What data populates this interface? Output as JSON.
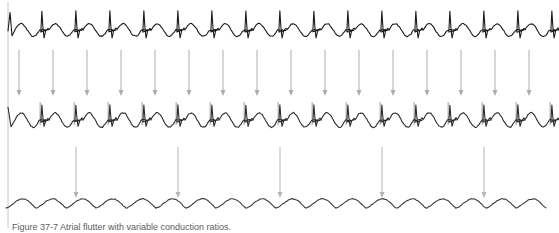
{
  "figure": {
    "background_color": "#ffffff",
    "width": 559,
    "height": 233,
    "left_rule": {
      "name": "left-vertical-rule",
      "color": "#c8c8c8",
      "x": 8,
      "y_top": 2,
      "y_bottom": 228,
      "width": 1
    },
    "caption": {
      "label": "Figure",
      "number": "37-7",
      "text": "Figure 37-7  Atrial flutter with variable conduction ratios.",
      "color": "#5c5c5c",
      "clipped": true,
      "note": "Caption line is cropped by the bottom edge of the image; only the upper sliver of glyphs is visible."
    }
  },
  "traces": [
    {
      "id": "strip-1",
      "name": "ecg-strip-top",
      "label": "Top rhythm strip",
      "color": "#1a1a1a",
      "stroke_width": 1.1,
      "baseline_y": 30,
      "x_start": 10,
      "x_end": 556,
      "beats": 16,
      "beat_spacing": 34,
      "morphology": "narrow QRS complexes with tall sharp R waves separated by rounded flutter/T waves; two rounded humps between each QRS",
      "qrs_amplitude": 19,
      "wave_amplitude": 7,
      "has_pacing_spikes": false
    },
    {
      "id": "strip-2",
      "name": "ecg-strip-middle",
      "label": "Middle rhythm strip",
      "color": "#2b2b2b",
      "stroke_width": 1.1,
      "baseline_y": 120,
      "x_start": 10,
      "x_end": 556,
      "beats": 16,
      "beat_spacing": 34,
      "morphology": "QRS complexes preceded by faint grey vertical marker spikes; rounded intervening waves, deeper S deflection",
      "qrs_amplitude": 15,
      "wave_amplitude": 8,
      "has_pacing_spikes": true,
      "spike_color": "#b9b9b9",
      "spike_height": 18
    },
    {
      "id": "strip-3",
      "name": "ecg-strip-bottom",
      "label": "Bottom rhythm strip",
      "color": "#3a3a3a",
      "stroke_width": 1.1,
      "baseline_y": 208,
      "x_start": 10,
      "x_end": 556,
      "beats": 18,
      "beat_spacing": 30,
      "morphology": "smooth undulating sawtooth flutter waves without discrete sharp QRS spikes",
      "qrs_amplitude": 0,
      "wave_amplitude": 9,
      "has_pacing_spikes": false
    }
  ],
  "arrow_rows": [
    {
      "id": "arrow-row-1",
      "name": "conduction-arrows-upper",
      "label": "Upper arrow row (strip 1 to strip 2)",
      "count": 16,
      "color": "#adadad",
      "line_width": 1,
      "y_top": 50,
      "y_bottom": 96,
      "x_first": 19,
      "spacing": 34,
      "head_width": 5,
      "head_height": 6,
      "direction": "down",
      "ratio_label": "1:1"
    },
    {
      "id": "arrow-row-2",
      "name": "conduction-arrows-lower",
      "label": "Lower arrow row (strip 2 to strip 3)",
      "count": 5,
      "color": "#b5b5b5",
      "line_width": 1,
      "y_top": 147,
      "y_bottom": 198,
      "x_first": 76,
      "spacing": 102,
      "head_width": 5,
      "head_height": 6,
      "direction": "down",
      "ratio_label": "1:3"
    }
  ]
}
